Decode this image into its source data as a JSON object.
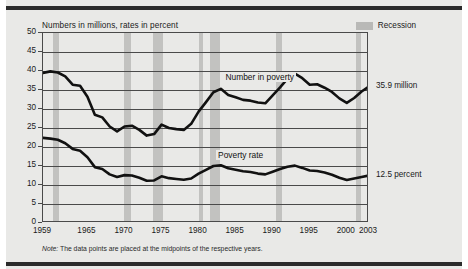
{
  "axis_title": "Numbers in millions, rates in percent",
  "legend": {
    "recession_label": "Recession",
    "swatch_color": "#c2c2c0"
  },
  "note": {
    "label": "Note:",
    "text": " The data points are placed at the midpoints of the respective years."
  },
  "end_labels": {
    "number": "35.9 million",
    "rate": "12.5 percent"
  },
  "series_labels": {
    "number": "Number in poverty",
    "rate": "Poverty rate"
  },
  "chart_data": {
    "type": "line",
    "title": "",
    "subtitle": "",
    "xlabel": "",
    "ylabel": "Numbers in millions, rates in percent",
    "xlim": [
      1959,
      2003
    ],
    "ylim": [
      0,
      50
    ],
    "yticks": [
      0,
      5,
      10,
      15,
      20,
      25,
      30,
      35,
      40,
      45,
      50
    ],
    "xticks": [
      1959,
      1965,
      1970,
      1975,
      1980,
      1985,
      1990,
      1995,
      2000,
      2003
    ],
    "grid": true,
    "legend_position": "top-right",
    "line_color": "#111111",
    "recession_color": "#c2c2c0",
    "plot_background": "#e9e9e7",
    "x": [
      1959,
      1960,
      1961,
      1962,
      1963,
      1964,
      1965,
      1966,
      1967,
      1968,
      1969,
      1970,
      1971,
      1972,
      1973,
      1974,
      1975,
      1976,
      1977,
      1978,
      1979,
      1980,
      1981,
      1982,
      1983,
      1984,
      1985,
      1986,
      1987,
      1988,
      1989,
      1990,
      1991,
      1992,
      1993,
      1994,
      1995,
      1996,
      1997,
      1998,
      1999,
      2000,
      2001,
      2002,
      2003
    ],
    "series": [
      {
        "name": "Number in poverty",
        "units": "millions",
        "end_value": 35.9,
        "values": [
          39.5,
          39.9,
          39.6,
          38.6,
          36.4,
          36.1,
          33.2,
          28.5,
          27.8,
          25.4,
          24.1,
          25.4,
          25.6,
          24.5,
          23.0,
          23.4,
          25.9,
          25.0,
          24.7,
          24.5,
          26.1,
          29.3,
          31.8,
          34.4,
          35.3,
          33.7,
          33.1,
          32.4,
          32.2,
          31.7,
          31.5,
          33.6,
          35.7,
          38.0,
          39.3,
          38.1,
          36.4,
          36.5,
          35.6,
          34.5,
          32.8,
          31.6,
          32.9,
          34.6,
          35.9
        ]
      },
      {
        "name": "Poverty rate",
        "units": "percent",
        "end_value": 12.5,
        "values": [
          22.4,
          22.2,
          21.9,
          21.0,
          19.5,
          19.0,
          17.3,
          14.7,
          14.2,
          12.8,
          12.1,
          12.6,
          12.5,
          11.9,
          11.1,
          11.2,
          12.3,
          11.8,
          11.6,
          11.4,
          11.7,
          13.0,
          14.0,
          15.0,
          15.2,
          14.4,
          14.0,
          13.6,
          13.4,
          13.0,
          12.8,
          13.5,
          14.2,
          14.8,
          15.1,
          14.5,
          13.8,
          13.7,
          13.3,
          12.7,
          11.9,
          11.3,
          11.7,
          12.1,
          12.5
        ]
      }
    ],
    "recessions": [
      {
        "start": 1960.3,
        "end": 1961.2
      },
      {
        "start": 1969.9,
        "end": 1970.9
      },
      {
        "start": 1973.9,
        "end": 1975.2
      },
      {
        "start": 1980.1,
        "end": 1980.6
      },
      {
        "start": 1981.5,
        "end": 1982.9
      },
      {
        "start": 1990.5,
        "end": 1991.2
      },
      {
        "start": 2001.2,
        "end": 2001.9
      }
    ]
  }
}
